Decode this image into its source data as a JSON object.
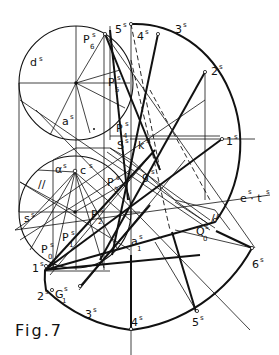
{
  "figure": {
    "caption": "Fig.7",
    "type": "descriptive geometry construction"
  },
  "labels": {
    "d": "d",
    "a": "a",
    "alpha": "α",
    "c": "c",
    "s_small": "s",
    "P0": "P",
    "P1": "P",
    "P2": "P",
    "P3": "P",
    "P4": "P",
    "P5": "P",
    "P6": "P",
    "S": "S",
    "k": "k",
    "g": "g",
    "e_t": "e · t",
    "Q0": "Q",
    "a1": "a",
    "G1": "G",
    "n1": "1",
    "n2": "2",
    "n3": "3",
    "n4": "4",
    "n5": "5",
    "n6": "6",
    "b1": "1",
    "b2": "2",
    "b3": "3",
    "b4": "4",
    "b5": "5",
    "sup_s": "s",
    "sub0": "0",
    "sub1": "1",
    "sub2": "2",
    "sub3": "3",
    "sub4": "4",
    "sub5": "5",
    "sub6": "6",
    "parallel_mark": "//"
  }
}
